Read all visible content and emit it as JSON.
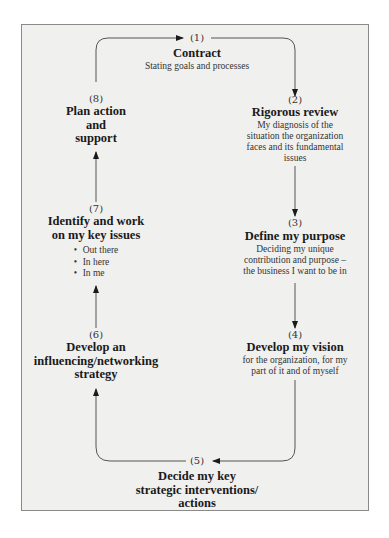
{
  "diagram": {
    "type": "cycle",
    "line_color": "#444444",
    "panel_background": "#f0f0ef",
    "steps": [
      {
        "number": "(1)",
        "title": "Contract",
        "description": "Stating goals and processes"
      },
      {
        "number": "(2)",
        "title": "Rigorous review",
        "description_lines": [
          "My diagnosis of the",
          "situation the organization",
          "faces and its fundamental",
          "issues"
        ]
      },
      {
        "number": "(3)",
        "title": "Define my purpose",
        "description_lines": [
          "Deciding my unique",
          "contribution and purpose –",
          "the business I want to be in"
        ]
      },
      {
        "number": "(4)",
        "title": "Develop my vision",
        "description_lines": [
          "for the organization, for my",
          "part of it and of myself"
        ]
      },
      {
        "number": "(5)",
        "title_lines": [
          "Decide my key",
          "strategic interventions/",
          "actions"
        ]
      },
      {
        "number": "(6)",
        "title_lines": [
          "Develop an",
          "influencing/networking",
          "strategy"
        ]
      },
      {
        "number": "(7)",
        "title_lines": [
          "Identify and work",
          "on my key issues"
        ],
        "bullets": [
          "Out there",
          "In here",
          "In me"
        ]
      },
      {
        "number": "(8)",
        "title_lines": [
          "Plan action",
          "and",
          "support"
        ]
      }
    ],
    "flow": [
      "1->2",
      "2->3",
      "3->4",
      "4->5",
      "5->6",
      "6->7",
      "7->8",
      "8->1"
    ]
  }
}
